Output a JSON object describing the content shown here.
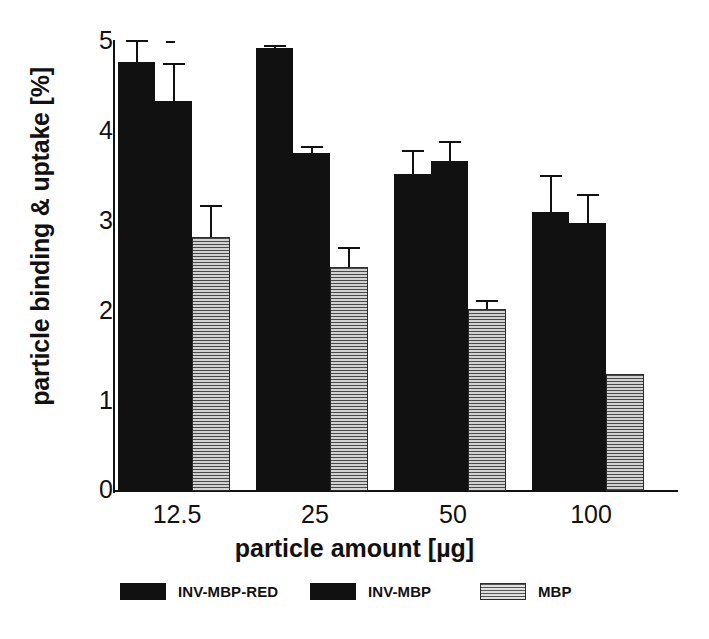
{
  "chart_data": {
    "type": "bar",
    "title": "",
    "xlabel": "particle amount [µg]",
    "ylabel": "particle binding & uptake [%]",
    "categories": [
      "12.5",
      "25",
      "50",
      "100"
    ],
    "ylim": [
      0,
      5
    ],
    "yticks": [
      "0",
      "1",
      "2",
      "3",
      "4",
      "5"
    ],
    "grid": false,
    "legend_position": "bottom",
    "series": [
      {
        "name": "INV-MBP-RED",
        "fill": "solid-black",
        "values": [
          4.78,
          4.93,
          3.53,
          3.11
        ],
        "errors": [
          0.22,
          0.02,
          0.25,
          0.39
        ]
      },
      {
        "name": "INV-MBP",
        "fill": "solid-black",
        "values": [
          4.34,
          3.76,
          3.67,
          2.99
        ],
        "errors": [
          0.4,
          0.06,
          0.21,
          0.29
        ]
      },
      {
        "name": "MBP",
        "fill": "horizontal-hatch-gray",
        "values": [
          2.83,
          2.49,
          2.03,
          1.3
        ],
        "errors": [
          0.33,
          0.21,
          0.07,
          0.0
        ]
      }
    ]
  },
  "axis": {
    "y_title": "particle binding & uptake [%]",
    "x_title": "particle amount [µg]",
    "y_tick_labels": [
      "5",
      "4",
      "3",
      "2",
      "1",
      "0"
    ],
    "x_tick_labels": [
      "12.5",
      "25",
      "50",
      "100"
    ]
  },
  "legend": {
    "items": [
      {
        "label": "INV-MBP-RED",
        "swatch": "solid"
      },
      {
        "label": "INV-MBP",
        "swatch": "solid"
      },
      {
        "label": "MBP",
        "swatch": "hatch"
      }
    ]
  },
  "caption": {
    "text": ""
  },
  "colors": {
    "bar_dark": "#111111",
    "bar_hatch_base": "#8a8a8a",
    "axis": "#111111",
    "background": "#ffffff"
  }
}
